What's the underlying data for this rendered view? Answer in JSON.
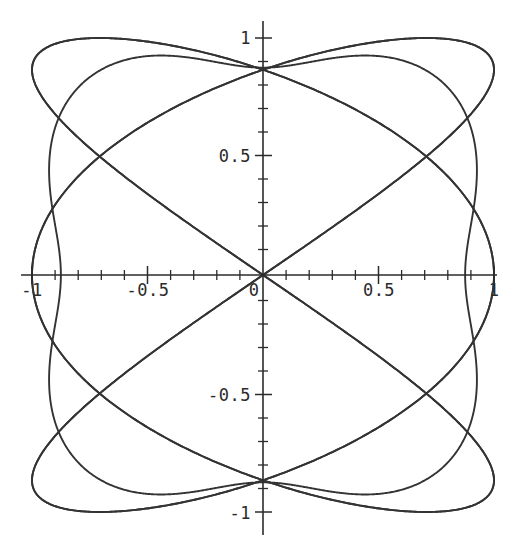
{
  "figure": {
    "name": "lissajous-plot",
    "background_color": "#ffffff",
    "width": 517,
    "height": 553
  },
  "chart_data": {
    "type": "line",
    "title": "",
    "xlabel": "",
    "ylabel": "",
    "xlim": [
      -1.08,
      1.08
    ],
    "ylim": [
      -1.08,
      1.08
    ],
    "grid": false,
    "legend": null,
    "axes_style": "centered-cross",
    "line_color": "#333333",
    "line_width": 1.9,
    "x_tick_labels": [
      "-1",
      "-0.5",
      "0",
      "0.5",
      "1"
    ],
    "x_tick_values": [
      -1,
      -0.5,
      0,
      0.5,
      1
    ],
    "y_tick_labels": [
      "-1",
      "-0.5",
      "0.5",
      "1"
    ],
    "y_tick_values": [
      -1,
      -0.5,
      0.5,
      1
    ],
    "minor_tick_step": 0.1,
    "origin_label": "0",
    "curves": [
      {
        "name": "outer-rounded-square",
        "kind": "parametric",
        "x_expr": "cos(t)*(1 - 0.12*cos(4t))",
        "y_expr": "sin(t)*(1 - 0.12*cos(4t))",
        "description": "outer rounded-square envelope of the Lissajous figure"
      },
      {
        "name": "diagonal-lobe-nw-se",
        "kind": "parametric",
        "x_expr": "sin(3t + pi/2)",
        "y_expr": "sin(2t)",
        "description": "lobe running from upper-left to lower-right"
      },
      {
        "name": "diagonal-lobe-sw-ne",
        "kind": "parametric",
        "x_expr": "sin(3t - pi/2)",
        "y_expr": "sin(2t)",
        "description": "lobe running from lower-left to upper-right"
      }
    ],
    "crossing_points": [
      [
        -0.78,
        0.0
      ],
      [
        0.32,
        0.0
      ],
      [
        -0.3,
        0.53
      ],
      [
        0.81,
        0.53
      ],
      [
        -0.3,
        -0.53
      ],
      [
        0.81,
        -0.53
      ]
    ]
  },
  "labels": {
    "x_neg_one": "-1",
    "x_neg_half": "-0.5",
    "x_zero": "0",
    "x_pos_half": "0.5",
    "x_pos_one": "1",
    "y_pos_one": "1",
    "y_pos_half": "0.5",
    "y_neg_half": "-0.5",
    "y_neg_one": "-1"
  }
}
